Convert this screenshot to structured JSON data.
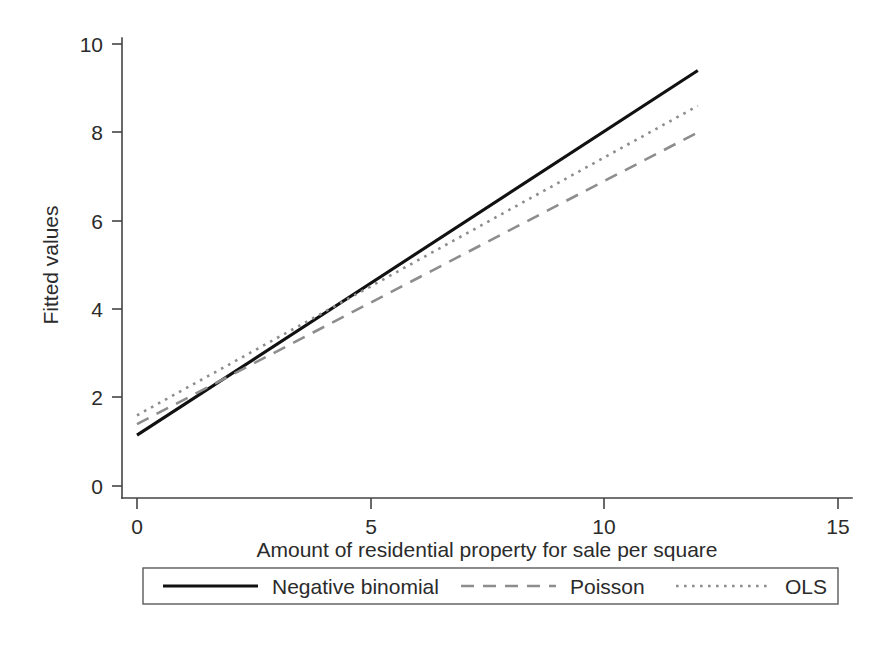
{
  "chart_data": {
    "type": "line",
    "title": "",
    "xlabel": "Amount of residential property for sale per square",
    "ylabel": "Fitted values",
    "xlim": [
      0,
      15
    ],
    "ylim": [
      0,
      10
    ],
    "xticks": [
      "0",
      "5",
      "10",
      "15"
    ],
    "xtick_values": [
      0,
      5,
      10,
      15
    ],
    "yticks": [
      "0",
      "2",
      "4",
      "6",
      "8",
      "10"
    ],
    "ytick_values": [
      0,
      2,
      4,
      6,
      8,
      10
    ],
    "grid": false,
    "legend_position": "below-axes",
    "x": [
      0,
      12
    ],
    "series": [
      {
        "name": "Negative binomial",
        "style": "solid",
        "color": "#111111",
        "values": [
          1.15,
          9.4
        ]
      },
      {
        "name": "Poisson",
        "style": "dashed",
        "color": "#8d8d8d",
        "values": [
          1.4,
          8.0
        ]
      },
      {
        "name": "OLS",
        "style": "dotted",
        "color": "#8d8d8d",
        "values": [
          1.6,
          8.6
        ]
      }
    ]
  },
  "axes": {
    "y_label": "Fitted values",
    "x_label": "Amount of residential property for sale per square",
    "y_tick_labels": [
      "10",
      "8",
      "6",
      "4",
      "2",
      "0"
    ],
    "x_tick_labels": [
      "0",
      "5",
      "10",
      "15"
    ]
  },
  "legend": {
    "items": [
      {
        "label": "Negative binomial"
      },
      {
        "label": "Poisson"
      },
      {
        "label": "OLS"
      }
    ]
  }
}
